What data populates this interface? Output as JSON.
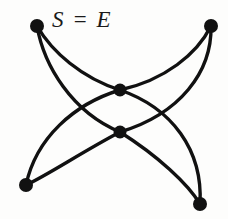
{
  "figure": {
    "title": "S = E",
    "background_color": "#fdfdfc",
    "stroke_color": "#111111",
    "vertex_color": "#111111",
    "width": 228,
    "height": 219
  },
  "label": {
    "text": "S = E",
    "left_symbol": "S",
    "relation": "=",
    "right_symbol": "E"
  },
  "graph_data": {
    "type": "graph",
    "vertex_count": 6,
    "edge_count": 8,
    "vertices": [
      {
        "id": "top-left",
        "x": 37,
        "y": 26,
        "radius": 7.0
      },
      {
        "id": "top-right",
        "x": 211,
        "y": 26,
        "radius": 7.0
      },
      {
        "id": "center-upper",
        "x": 120,
        "y": 90,
        "radius": 6.5
      },
      {
        "id": "center-lower",
        "x": 120,
        "y": 132,
        "radius": 6.5
      },
      {
        "id": "bottom-left",
        "x": 26,
        "y": 185,
        "radius": 7.0
      },
      {
        "id": "bottom-right",
        "x": 200,
        "y": 204,
        "radius": 7.0
      }
    ],
    "edges": [
      {
        "id": "e1",
        "from": "top-left",
        "to": "center-upper",
        "path": "M 37 26 C 52 52 82 78 120 90"
      },
      {
        "id": "e2",
        "from": "top-right",
        "to": "center-upper",
        "path": "M 211 26 C 197 54 165 80 120 90"
      },
      {
        "id": "e3",
        "from": "top-left",
        "to": "center-lower",
        "path": "M 37 26 C 44 66 72 112 120 132"
      },
      {
        "id": "e4",
        "from": "top-right",
        "to": "center-lower",
        "path": "M 211 26 C 212 72 180 114 120 132"
      },
      {
        "id": "e5",
        "from": "center-upper",
        "to": "bottom-left",
        "path": "M 120 90 C 74 104 36 138 26 185"
      },
      {
        "id": "e6",
        "from": "center-upper",
        "to": "bottom-right",
        "path": "M 120 90 C 172 108 203 150 200 204"
      },
      {
        "id": "e7",
        "from": "center-lower",
        "to": "bottom-left",
        "path": "M 120 132 C 82 152 46 176 26 185"
      },
      {
        "id": "e8",
        "from": "center-lower",
        "to": "bottom-right",
        "path": "M 120 132 C 158 156 188 184 200 204"
      }
    ],
    "crossings": [
      {
        "x": 62,
        "y": 110
      },
      {
        "x": 177,
        "y": 112
      }
    ]
  }
}
